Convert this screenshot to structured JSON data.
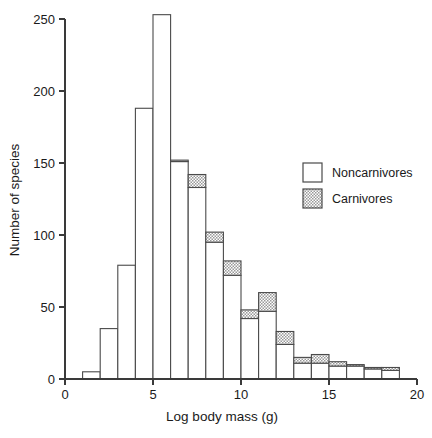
{
  "chart_data": {
    "type": "bar",
    "title": "",
    "subtitle": "",
    "xlabel": "Log body mass (g)",
    "ylabel": "Number of species",
    "xlim": [
      0,
      20
    ],
    "ylim": [
      0,
      250
    ],
    "xticks": [
      0,
      5,
      10,
      15,
      20
    ],
    "yticks": [
      0,
      50,
      100,
      150,
      200,
      250
    ],
    "xtick_labels": [
      "0",
      "5",
      "10",
      "15",
      "20"
    ],
    "ytick_labels": [
      "0",
      "50",
      "100",
      "150",
      "200",
      "250"
    ],
    "grid": false,
    "stacked": true,
    "bin_width": 1,
    "bin_starts": [
      1,
      2,
      3,
      4,
      5,
      6,
      7,
      8,
      9,
      10,
      11,
      12,
      13,
      14,
      15,
      16,
      17,
      18
    ],
    "categories": [
      "1-2",
      "2-3",
      "3-4",
      "4-5",
      "5-6",
      "6-7",
      "7-8",
      "8-9",
      "9-10",
      "10-11",
      "11-12",
      "12-13",
      "13-14",
      "14-15",
      "15-16",
      "16-17",
      "17-18",
      "18-19"
    ],
    "series": [
      {
        "name": "Noncarnivores",
        "fill": "white",
        "values": [
          5,
          35,
          79,
          188,
          253,
          151,
          133,
          95,
          72,
          42,
          47,
          24,
          11,
          11,
          9,
          9,
          7,
          6
        ]
      },
      {
        "name": "Carnivores",
        "fill": "hatched",
        "values": [
          0,
          0,
          0,
          0,
          0,
          1,
          9,
          7,
          10,
          6,
          13,
          9,
          4,
          6,
          3,
          1,
          1,
          2
        ]
      }
    ],
    "totals": [
      5,
      35,
      79,
      188,
      253,
      152,
      142,
      102,
      82,
      48,
      60,
      33,
      15,
      17,
      12,
      10,
      8,
      8
    ],
    "legend_position": "upper right",
    "colors": {
      "noncarnivores": "#ffffff",
      "carnivores": "#c8c8c8",
      "outline": "#4a4a4a",
      "axis": "#3a3a3a",
      "text": "#1a1a1a"
    }
  },
  "legend": {
    "entries": [
      {
        "label": "Noncarnivores",
        "swatch": "empty-swatch"
      },
      {
        "label": "Carnivores",
        "swatch": "hatched-swatch"
      }
    ]
  },
  "axes": {
    "y_title": "Number of species",
    "x_title": "Log body mass (g)"
  }
}
